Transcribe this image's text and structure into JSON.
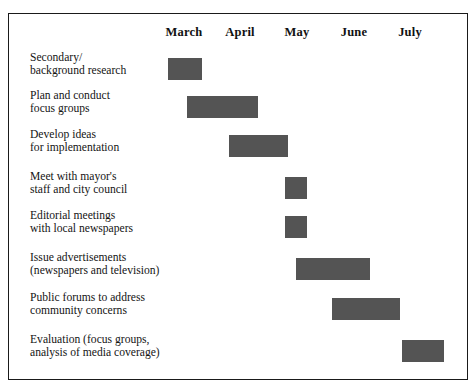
{
  "chart_data": {
    "type": "bar",
    "orientation": "horizontal",
    "subtype": "gantt",
    "title": "",
    "xlabel": "",
    "ylabel": "",
    "grid": false,
    "legend": null,
    "bar_color": "#545454",
    "frame_color": "#1a1a1a",
    "background": "#ffffff",
    "categories": [
      "March",
      "April",
      "May",
      "June",
      "July"
    ],
    "tasks": [
      {
        "label_lines": [
          "Secondary/",
          "background research"
        ],
        "start": "March",
        "end": "March",
        "duration_months": 0.6,
        "bar": {
          "x": 168,
          "y": 58,
          "width": 34,
          "height": 22
        }
      },
      {
        "label_lines": [
          "Plan and conduct",
          "focus groups"
        ],
        "start": "March",
        "end": "April",
        "duration_months": 1.25,
        "bar": {
          "x": 187,
          "y": 96,
          "width": 71,
          "height": 22
        }
      },
      {
        "label_lines": [
          "Develop ideas",
          "for implementation"
        ],
        "start": "April",
        "end": "May",
        "duration_months": 1.05,
        "bar": {
          "x": 229,
          "y": 135,
          "width": 59,
          "height": 22
        }
      },
      {
        "label_lines": [
          "Meet with mayor's",
          "staff and city council"
        ],
        "start": "May",
        "end": "May",
        "duration_months": 0.4,
        "bar": {
          "x": 285,
          "y": 177,
          "width": 22,
          "height": 22
        }
      },
      {
        "label_lines": [
          "Editorial meetings",
          "with local newspapers"
        ],
        "start": "May",
        "end": "May",
        "duration_months": 0.4,
        "bar": {
          "x": 285,
          "y": 216,
          "width": 22,
          "height": 22
        }
      },
      {
        "label_lines": [
          "Issue advertisements",
          "(newspapers and television)"
        ],
        "start": "May",
        "end": "June",
        "duration_months": 1.3,
        "bar": {
          "x": 296,
          "y": 258,
          "width": 74,
          "height": 22
        }
      },
      {
        "label_lines": [
          "Public forums to address",
          "community concerns"
        ],
        "start": "June",
        "end": "July",
        "duration_months": 1.2,
        "bar": {
          "x": 332,
          "y": 298,
          "width": 68,
          "height": 22
        }
      },
      {
        "label_lines": [
          "Evaluation (focus groups,",
          "analysis of media coverage)"
        ],
        "start": "July",
        "end": "July",
        "duration_months": 0.75,
        "bar": {
          "x": 402,
          "y": 340,
          "width": 42,
          "height": 22
        }
      }
    ],
    "month_label_positions": [
      {
        "name": "March",
        "center_x": 184
      },
      {
        "name": "April",
        "center_x": 240
      },
      {
        "name": "May",
        "center_x": 297
      },
      {
        "name": "June",
        "center_x": 354
      },
      {
        "name": "July",
        "center_x": 410
      }
    ]
  }
}
